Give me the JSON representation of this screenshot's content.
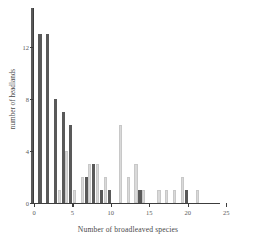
{
  "chart_data": {
    "type": "bar",
    "title": "",
    "xlabel": "Number of broadleaved species",
    "ylabel": "number of headlands",
    "xlim": [
      0,
      25.5
    ],
    "ylim": [
      0,
      15
    ],
    "grid": false,
    "legend": null,
    "xticks": [
      0,
      5,
      10,
      15,
      20,
      25
    ],
    "yticks": [
      0,
      4,
      8,
      12
    ],
    "categories": [
      0,
      1,
      2,
      3,
      4,
      5,
      6,
      7,
      8,
      9,
      10,
      11,
      12,
      13,
      14,
      15,
      16,
      17,
      18,
      19,
      20,
      21,
      22,
      23,
      24,
      25
    ],
    "series": [
      {
        "name": "dark",
        "color": "#595959",
        "values": [
          15,
          13,
          13,
          8,
          7,
          6,
          0,
          2,
          3,
          1,
          1,
          0,
          0,
          0,
          1,
          0,
          0,
          0,
          0,
          0,
          1,
          0,
          0,
          0,
          0,
          0
        ]
      },
      {
        "name": "light",
        "color": "#d9d9d9",
        "values": [
          0,
          0,
          0,
          1,
          4,
          1,
          2,
          3,
          3,
          2,
          0,
          6,
          2,
          3,
          1,
          0,
          1,
          1,
          1,
          2,
          0,
          1,
          0,
          0,
          0,
          0
        ]
      }
    ]
  },
  "axis": {
    "x_tick_labels": [
      "0",
      "5",
      "10",
      "15",
      "20",
      "25"
    ],
    "y_tick_labels": [
      "0",
      "4",
      "8",
      "12"
    ]
  }
}
